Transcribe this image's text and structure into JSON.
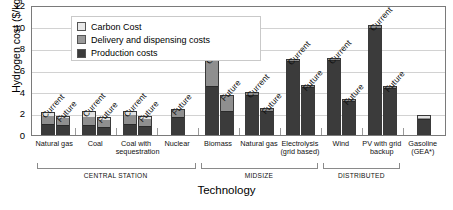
{
  "chart_data": {
    "type": "bar",
    "subtype": "stacked-grouped-bar",
    "title": "",
    "xlabel": "Technology",
    "ylabel": "Hydrogen cost ($/kg)",
    "ylim": [
      0,
      12
    ],
    "yticks": [
      0,
      2,
      4,
      6,
      8,
      10,
      12
    ],
    "grid": true,
    "legend_position": "top-left",
    "legend": [
      {
        "key": "carbon",
        "label": "Carbon Cost",
        "color": "#e8e8e8"
      },
      {
        "key": "delivery",
        "label": "Delivery and dispensing costs",
        "color": "#9a9a9a"
      },
      {
        "key": "production",
        "label": "Production costs",
        "color": "#3b3b3b"
      }
    ],
    "series_order": [
      "production",
      "delivery",
      "carbon"
    ],
    "sections": [
      {
        "label": "CENTRAL STATION",
        "categories": [
          "Natural gas",
          "Coal",
          "Coal with sequestration",
          "Nuclear"
        ]
      },
      {
        "label": "MIDSIZE",
        "categories": [
          "Biomass",
          "Natural gas",
          "Electrolysis (grid based)"
        ]
      },
      {
        "label": "DISTRIBUTED",
        "categories": [
          "Wind",
          "PV with grid backup"
        ]
      },
      {
        "label": "",
        "categories": [
          "Gasoline (GEA*)"
        ]
      }
    ],
    "categories": [
      {
        "label": "Natural gas",
        "label_lines": [
          "Natural gas"
        ],
        "section": "CENTRAL STATION",
        "bars": [
          {
            "scenario": "Current",
            "production": 1.1,
            "delivery": 0.75,
            "carbon": 0.25,
            "total": 2.1
          },
          {
            "scenario": "Future",
            "production": 1.0,
            "delivery": 0.7,
            "carbon": 0.1,
            "total": 1.8
          }
        ]
      },
      {
        "label": "Coal",
        "label_lines": [
          "Coal"
        ],
        "section": "CENTRAL STATION",
        "bars": [
          {
            "scenario": "Current",
            "production": 1.0,
            "delivery": 0.75,
            "carbon": 0.5,
            "total": 2.25
          },
          {
            "scenario": "Future",
            "production": 0.8,
            "delivery": 0.65,
            "carbon": 0.2,
            "total": 1.65
          }
        ]
      },
      {
        "label": "Coal with sequestration",
        "label_lines": [
          "Coal with",
          "sequestration"
        ],
        "section": "CENTRAL STATION",
        "bars": [
          {
            "scenario": "Current",
            "production": 1.1,
            "delivery": 0.8,
            "carbon": 0.35,
            "total": 2.25
          },
          {
            "scenario": "Future",
            "production": 0.9,
            "delivery": 0.7,
            "carbon": 0.15,
            "total": 1.75
          }
        ]
      },
      {
        "label": "Nuclear",
        "label_lines": [
          "Nuclear"
        ],
        "section": "CENTRAL STATION",
        "bars": [
          {
            "scenario": "Future",
            "production": 1.75,
            "delivery": 0.65,
            "carbon": 0.0,
            "total": 2.4
          }
        ]
      },
      {
        "label": "Biomass",
        "label_lines": [
          "Biomass"
        ],
        "section": "MIDSIZE",
        "bars": [
          {
            "scenario": "Current",
            "production": 4.65,
            "delivery": 2.45,
            "carbon": 0.0,
            "total": 7.1
          },
          {
            "scenario": "Future",
            "production": 2.35,
            "delivery": 1.3,
            "carbon": 0.0,
            "total": 3.65
          }
        ]
      },
      {
        "label": "Natural gas",
        "label_lines": [
          "Natural gas"
        ],
        "section": "MIDSIZE",
        "bars": [
          {
            "scenario": "Current",
            "production": 3.75,
            "delivery": 0.2,
            "carbon": 0.0,
            "total": 3.95
          },
          {
            "scenario": "Future",
            "production": 2.3,
            "delivery": 0.15,
            "carbon": 0.0,
            "total": 2.45
          }
        ]
      },
      {
        "label": "Electrolysis (grid based)",
        "label_lines": [
          "Electrolysis",
          "(grid based)"
        ],
        "section": "MIDSIZE",
        "bars": [
          {
            "scenario": "Current",
            "production": 6.95,
            "delivery": 0.1,
            "carbon": 0.0,
            "total": 7.05
          },
          {
            "scenario": "Future",
            "production": 4.55,
            "delivery": 0.1,
            "carbon": 0.0,
            "total": 4.65
          }
        ]
      },
      {
        "label": "Wind",
        "label_lines": [
          "Wind"
        ],
        "section": "DISTRIBUTED",
        "bars": [
          {
            "scenario": "Current",
            "production": 7.05,
            "delivery": 0.1,
            "carbon": 0.0,
            "total": 7.15
          },
          {
            "scenario": "Future",
            "production": 3.25,
            "delivery": 0.1,
            "carbon": 0.0,
            "total": 3.35
          }
        ]
      },
      {
        "label": "PV with grid backup",
        "label_lines": [
          "PV with grid",
          "backup"
        ],
        "section": "DISTRIBUTED",
        "bars": [
          {
            "scenario": "Current",
            "production": 10.0,
            "delivery": 0.15,
            "carbon": 0.0,
            "total": 10.15
          },
          {
            "scenario": "Future",
            "production": 4.4,
            "delivery": 0.15,
            "carbon": 0.0,
            "total": 4.55
          }
        ]
      },
      {
        "label": "Gasoline (GEA*)",
        "label_lines": [
          "Gasoline",
          "(GEA*)"
        ],
        "section": "",
        "bars": [
          {
            "scenario": "",
            "production": 1.55,
            "delivery": 0.15,
            "carbon": 0.15,
            "total": 1.85
          }
        ]
      }
    ]
  }
}
